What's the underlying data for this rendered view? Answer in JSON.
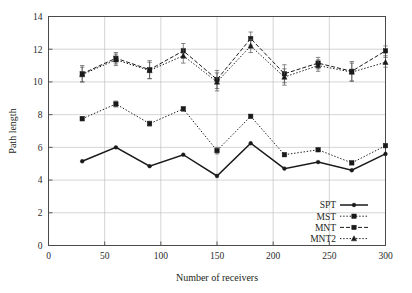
{
  "chart_data": {
    "type": "line",
    "title": "",
    "xlabel": "Number of receivers",
    "ylabel": "Path length",
    "xlim": [
      0,
      300
    ],
    "ylim": [
      0,
      14
    ],
    "xticks": [
      0,
      50,
      100,
      150,
      200,
      250,
      300
    ],
    "yticks": [
      0,
      2,
      4,
      6,
      8,
      10,
      12,
      14
    ],
    "xtick_labels": [
      "0",
      "50",
      "100",
      "150",
      "200",
      "250",
      "300"
    ],
    "ytick_labels": [
      "0",
      "2",
      "4",
      "6",
      "8",
      "10",
      "12",
      "14"
    ],
    "grid": true,
    "legend_position": "lower right",
    "x": [
      30,
      60,
      90,
      120,
      150,
      180,
      210,
      240,
      270,
      300
    ],
    "series": [
      {
        "name": "SPT",
        "style": "solid",
        "marker": "dot",
        "values": [
          5.15,
          6.0,
          4.85,
          5.55,
          4.25,
          6.25,
          4.7,
          5.1,
          4.6,
          5.6
        ],
        "errors": [
          0,
          0,
          0,
          0,
          0,
          0,
          0,
          0,
          0,
          0
        ]
      },
      {
        "name": "MST",
        "style": "dotted",
        "marker": "square",
        "values": [
          7.75,
          8.65,
          7.45,
          8.35,
          5.8,
          7.9,
          5.55,
          5.85,
          5.05,
          6.1
        ],
        "errors": [
          0.12,
          0.18,
          0.15,
          0.12,
          0.2,
          0.1,
          0.1,
          0.1,
          0.1,
          0.1
        ]
      },
      {
        "name": "MNT",
        "style": "dashed",
        "marker": "square",
        "values": [
          10.5,
          11.45,
          10.75,
          11.9,
          10.15,
          12.65,
          10.5,
          11.15,
          10.65,
          11.9
        ],
        "errors": [
          0.5,
          0.35,
          0.55,
          0.45,
          0.55,
          0.4,
          0.55,
          0.35,
          0.6,
          0.3
        ]
      },
      {
        "name": "MNT2",
        "style": "dotted",
        "marker": "triangle",
        "values": [
          10.45,
          11.35,
          10.7,
          11.6,
          10.0,
          12.2,
          10.3,
          11.0,
          10.6,
          11.2
        ],
        "errors": [
          0.45,
          0.35,
          0.5,
          0.45,
          0.55,
          0.4,
          0.5,
          0.35,
          0.55,
          0.3
        ]
      }
    ],
    "colors": {
      "line": "#1a1a1a",
      "grid": "#b9b9b9",
      "frame": "#4a4a4a",
      "text": "#231f20",
      "background": "#ffffff"
    }
  },
  "legend": {
    "items": [
      {
        "label": "SPT"
      },
      {
        "label": "MST"
      },
      {
        "label": "MNT"
      },
      {
        "label": "MNT2"
      }
    ]
  }
}
